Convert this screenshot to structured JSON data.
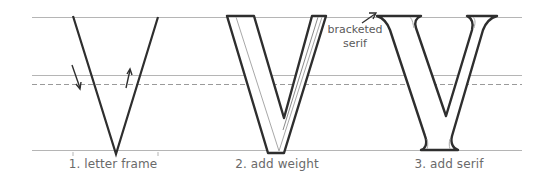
{
  "diagram": {
    "colors": {
      "guideline": "#b5b5b5",
      "stroke": "#2e2e2e",
      "thin_stroke": "#a8a8a8",
      "caption": "#6a6a6a"
    },
    "guidelines": {
      "x_start": 32,
      "x_end": 522,
      "cap_line_y": 17,
      "mid_line_y": 75,
      "dashed_line_y": 84,
      "baseline_y": 150
    },
    "steps": [
      {
        "number": 1,
        "label": "1. letter frame",
        "caption_x": 113
      },
      {
        "number": 2,
        "label": "2. add weight",
        "caption_x": 277
      },
      {
        "number": 3,
        "label": "3. add serif",
        "caption_x": 449
      }
    ],
    "annotation": {
      "line1": "bracketed",
      "line2": "serif"
    }
  }
}
